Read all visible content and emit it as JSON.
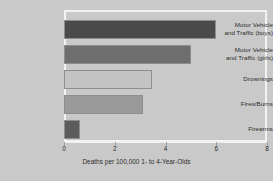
{
  "chart_data": {
    "type": "bar",
    "orientation": "horizontal",
    "title": "",
    "xlabel": "Deaths per 100,000 1- to 4-Year-Olds",
    "ylabel": "",
    "xlim": [
      0,
      8
    ],
    "xticks": [
      "0",
      "2",
      "4",
      "6",
      "8"
    ],
    "xtick_values": [
      0,
      2,
      4,
      6,
      8
    ],
    "grid": false,
    "legend": null,
    "categories": [
      "Motor Vehicle and Traffic (boys)",
      "Motor Vehicle and Traffic (girls)",
      "Drownings",
      "Fires/Burns",
      "Firearms"
    ],
    "category_lines": [
      [
        "Motor Vehicle",
        "and Traffic (boys)"
      ],
      [
        "Motor Vehicle",
        "and Traffic (girls)"
      ],
      [
        "Drownings"
      ],
      [
        "Fires/Burns"
      ],
      [
        "Firearms"
      ]
    ],
    "values": [
      6.0,
      5.0,
      3.45,
      3.1,
      0.62
    ],
    "bar_colors": [
      "#4a4a4a",
      "#6e6e6e",
      "#c3c3c3",
      "#9a9a9a",
      "#5c5c5c"
    ],
    "bar_edge_color": "#8e8e8e"
  },
  "colors": {
    "background": "#c9c9c9",
    "frame": "#f2f2f2",
    "text": "#2b2b2b",
    "tick": "#9d9d9d"
  }
}
